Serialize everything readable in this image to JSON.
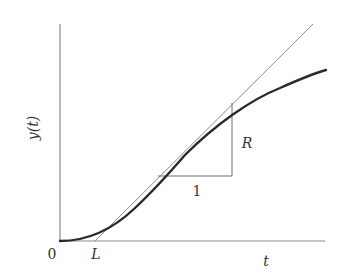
{
  "figure": {
    "type": "step-response-tangent-construction",
    "colors": {
      "axis": "#8a8a8a",
      "curve": "#2a2a2a",
      "tangent": "#8a8a8a",
      "triangle": "#6e6e6e",
      "text": "#333333"
    },
    "labels": {
      "y_axis": "y(t)",
      "x_axis": "t",
      "origin": "0",
      "lag": "L",
      "run": "1",
      "rise": "R"
    }
  }
}
